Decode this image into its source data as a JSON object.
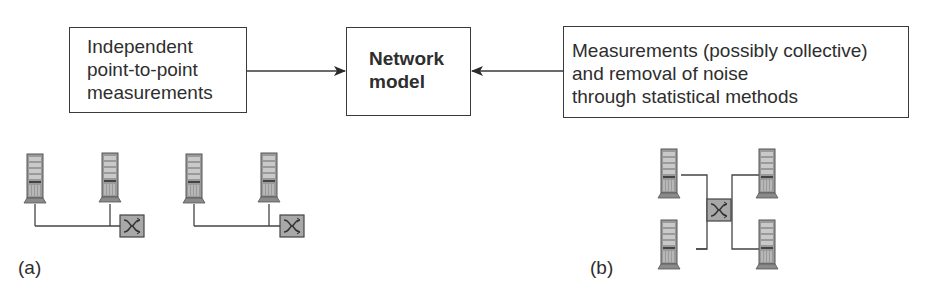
{
  "diagram": {
    "boxes": {
      "left": {
        "lines": [
          "Independent",
          "point-to-point",
          "measurements"
        ]
      },
      "center": {
        "lines": [
          "Network",
          "model"
        ]
      },
      "right": {
        "lines": [
          "Measurements (possibly collective)",
          "and removal of noise",
          "through statistical methods"
        ]
      }
    },
    "arrows": [
      {
        "from": "left",
        "to": "center"
      },
      {
        "from": "right",
        "to": "center"
      }
    ],
    "panels": {
      "a": {
        "label": "(a)",
        "description": "Two pairs of servers, each pair connected via a switch"
      },
      "b": {
        "label": "(b)",
        "description": "Four servers connected to a central switch"
      }
    },
    "icons": {
      "server": "server-tower-icon",
      "switch": "network-switch-icon"
    },
    "colors": {
      "line": "#3a3a3a",
      "server_fill": "#9a9a9a",
      "switch_fill": "#a8a8a8"
    }
  }
}
